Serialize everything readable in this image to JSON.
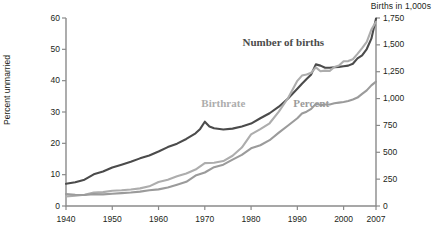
{
  "chart_data": {
    "type": "line",
    "title": "",
    "left_axis": {
      "label": "Percent unmarried",
      "ticks": [
        "0",
        "10",
        "20",
        "30",
        "40",
        "50",
        "60"
      ],
      "ylim": [
        0,
        60
      ]
    },
    "right_axis": {
      "label": "Births in 1,000s",
      "ticks": [
        "0",
        "250",
        "500",
        "750",
        "1,000",
        "1,250",
        "1,500",
        "1,750"
      ],
      "ylim": [
        0,
        1750
      ]
    },
    "xlabel": "",
    "x_ticks": [
      "1940",
      "1950",
      "1960",
      "1970",
      "1980",
      "1990",
      "2000",
      "2007"
    ],
    "xlim": [
      1940,
      2007
    ],
    "grid": false,
    "legend_position": "inline-labels",
    "series": [
      {
        "name": "Birthrate",
        "axis": "left",
        "color": "#4b4b4b",
        "label_text": "Birthrate",
        "x": [
          1940,
          1942,
          1944,
          1946,
          1948,
          1950,
          1952,
          1954,
          1956,
          1958,
          1960,
          1962,
          1964,
          1966,
          1968,
          1969,
          1970,
          1971,
          1972,
          1974,
          1976,
          1978,
          1980,
          1982,
          1984,
          1986,
          1988,
          1990,
          1991,
          1992,
          1993,
          1994,
          1995,
          1996,
          1997,
          1998,
          1999,
          2000,
          2001,
          2002,
          2003,
          2004,
          2005,
          2006,
          2007
        ],
        "values": [
          7.1,
          7.6,
          8.4,
          10.1,
          11.0,
          12.3,
          13.2,
          14.1,
          15.2,
          16.1,
          17.4,
          18.8,
          19.9,
          21.4,
          23.2,
          24.6,
          26.9,
          25.4,
          24.8,
          24.4,
          24.7,
          25.4,
          26.3,
          28.0,
          29.6,
          31.7,
          34.3,
          37.4,
          39.0,
          40.5,
          42.0,
          45.2,
          44.8,
          44.1,
          44.1,
          44.3,
          44.4,
          44.6,
          44.8,
          45.4,
          47.1,
          48.1,
          50.1,
          53.4,
          59.8
        ]
      },
      {
        "name": "Number of births",
        "axis": "right",
        "color": "#adadad",
        "label_text": "Number of births",
        "x": [
          1940,
          1942,
          1944,
          1946,
          1948,
          1950,
          1952,
          1954,
          1956,
          1958,
          1960,
          1962,
          1964,
          1966,
          1968,
          1970,
          1972,
          1974,
          1976,
          1978,
          1980,
          1982,
          1984,
          1986,
          1988,
          1990,
          1991,
          1992,
          1993,
          1994,
          1995,
          1996,
          1997,
          1998,
          1999,
          2000,
          2001,
          2002,
          2003,
          2004,
          2005,
          2006,
          2007
        ],
        "values": [
          89,
          95,
          105,
          125,
          129,
          142,
          147,
          154,
          164,
          183,
          224,
          245,
          276,
          302,
          339,
          399,
          403,
          418,
          468,
          544,
          666,
          715,
          770,
          878,
          1005,
          1165,
          1214,
          1225,
          1240,
          1290,
          1254,
          1260,
          1258,
          1294,
          1308,
          1347,
          1349,
          1366,
          1416,
          1470,
          1527,
          1642,
          1715
        ]
      },
      {
        "name": "Percent",
        "axis": "left",
        "color": "#9b9b9b",
        "label_text": "Percent",
        "x": [
          1940,
          1942,
          1944,
          1946,
          1948,
          1950,
          1952,
          1954,
          1956,
          1958,
          1960,
          1962,
          1964,
          1966,
          1968,
          1970,
          1972,
          1974,
          1976,
          1978,
          1980,
          1982,
          1984,
          1986,
          1988,
          1990,
          1991,
          1992,
          1993,
          1994,
          1995,
          1996,
          1997,
          1998,
          1999,
          2000,
          2001,
          2002,
          2003,
          2004,
          2005,
          2006,
          2007
        ],
        "values": [
          3.8,
          3.6,
          3.5,
          3.8,
          3.7,
          3.9,
          4.1,
          4.3,
          4.6,
          5.0,
          5.3,
          5.9,
          6.8,
          7.7,
          9.7,
          10.7,
          12.4,
          13.2,
          14.8,
          16.3,
          18.4,
          19.4,
          21.0,
          23.4,
          25.7,
          28.0,
          29.5,
          30.1,
          31.0,
          32.6,
          32.2,
          32.4,
          32.4,
          32.8,
          33.0,
          33.2,
          33.5,
          34.0,
          34.6,
          35.8,
          36.9,
          38.5,
          39.7
        ]
      }
    ],
    "annotations": [
      {
        "text": "Number of births",
        "x": 1987,
        "y_px": 36
      },
      {
        "text": "Birthrate",
        "x": 1974,
        "y_px": 97
      },
      {
        "text": "Percent",
        "x": 1993,
        "y_px": 97
      }
    ]
  },
  "axis_style": {
    "axis_color": "#8a8a8a",
    "text_color": "#231f20"
  }
}
